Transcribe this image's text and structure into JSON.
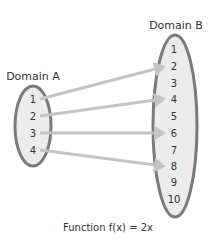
{
  "domain_a": {
    "label": "Domain A",
    "values": [
      "1",
      "2",
      "3",
      "4"
    ]
  },
  "domain_b": {
    "label": "Domain B",
    "values": [
      "1",
      "2",
      "3",
      "4",
      "5",
      "6",
      "7",
      "8",
      "9",
      "10"
    ]
  },
  "mappings": [
    {
      "from": "1",
      "to": "2"
    },
    {
      "from": "2",
      "to": "4"
    },
    {
      "from": "3",
      "to": "6"
    },
    {
      "from": "4",
      "to": "8"
    }
  ],
  "caption": "Function f(x) = 2x",
  "colors": {
    "ellipse_fill": "#ececec",
    "ellipse_stroke": "#7a7a7a",
    "arrow": "#c4c4c4",
    "text": "#333333"
  }
}
